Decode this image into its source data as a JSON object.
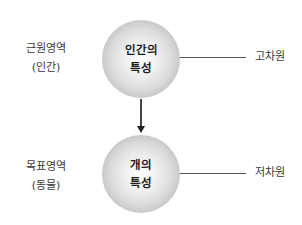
{
  "diagram": {
    "source": {
      "domain_label": "근원영역",
      "domain_sub": "(인간)",
      "node_line1": "인간의",
      "node_line2": "특성",
      "level_label": "고차원"
    },
    "target": {
      "domain_label": "목표영역",
      "domain_sub": "(동물)",
      "node_line1": "개의",
      "node_line2": "특성",
      "level_label": "저차원"
    },
    "arrow": {
      "from": "source",
      "to": "target",
      "direction": "down"
    },
    "colors": {
      "sphere_center": "#ffffff",
      "sphere_edge": "#a9a9a9",
      "line": "#555555",
      "text": "#3a3a3a",
      "node_text": "#1e1e1e"
    }
  }
}
